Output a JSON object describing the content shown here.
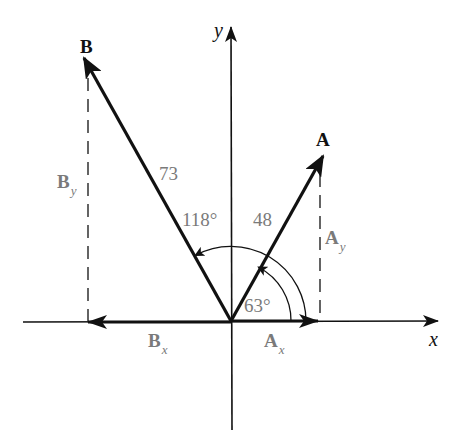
{
  "diagram": {
    "type": "vector-components",
    "colors": {
      "vector": "#111111",
      "axis": "#111111",
      "label_gray": "#7a7a7a",
      "background": "#ffffff"
    },
    "axes": {
      "x_label": "x",
      "y_label": "y"
    },
    "vectors": [
      {
        "name": "A",
        "magnitude_label": "48",
        "angle_label": "63°",
        "x_component": {
          "symbol": "A",
          "subscript": "x"
        },
        "y_component": {
          "symbol": "A",
          "subscript": "y"
        }
      },
      {
        "name": "B",
        "magnitude_label": "73",
        "angle_label": "118°",
        "x_component": {
          "symbol": "B",
          "subscript": "x"
        },
        "y_component": {
          "symbol": "B",
          "subscript": "y"
        }
      }
    ]
  }
}
